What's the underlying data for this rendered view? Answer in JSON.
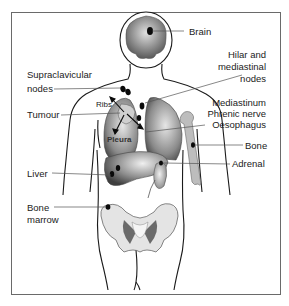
{
  "diagram": {
    "labels": {
      "brain": "Brain",
      "hilar": [
        "Hilar and",
        "mediastinal",
        "nodes"
      ],
      "supraclavicular": [
        "Supraclavicular",
        "nodes"
      ],
      "mediastinum": [
        "Mediastinum",
        "Phrenic nerve",
        "Oesophagus"
      ],
      "tumour": "Tumour",
      "ribs": "Ribs",
      "pleura": "Pleura",
      "bone": "Bone",
      "adrenal": "Adrenal",
      "liver": "Liver",
      "bone_marrow": [
        "Bone",
        "marrow"
      ]
    },
    "colors": {
      "outline": "#1a1a1a",
      "organ_dark": "#5a5a5a",
      "organ_light": "#d8d8d8",
      "bone": "#bdbdbd",
      "lesion": "#0a0a0a",
      "frame": "#6a6a6a"
    }
  }
}
